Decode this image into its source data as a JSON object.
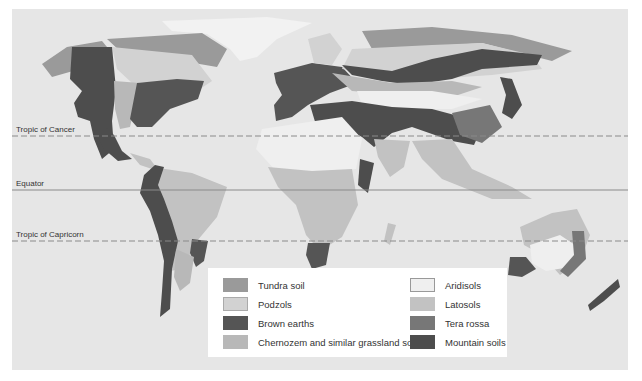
{
  "map": {
    "title": "World soil types",
    "reference_lines": [
      {
        "id": "tropic-of-cancer",
        "label": "Tropic of Cancer",
        "style": "dashed",
        "y": 127
      },
      {
        "id": "equator",
        "label": "Equator",
        "style": "solid",
        "y": 181
      },
      {
        "id": "tropic-of-capricorn",
        "label": "Tropic of Capricorn",
        "style": "dashed",
        "y": 232
      }
    ]
  },
  "legend": {
    "items": [
      {
        "label": "Tundra soil",
        "color": "#9a9a9a"
      },
      {
        "label": "Podzols",
        "color": "#d2d2d2"
      },
      {
        "label": "Brown earths",
        "color": "#555555"
      },
      {
        "label": "Chernozem and similar grassland soils",
        "color": "#b8b8b8"
      },
      {
        "label": "Aridisols",
        "color": "#efefef"
      },
      {
        "label": "Latosols",
        "color": "#c2c2c2"
      },
      {
        "label": "Tera rossa",
        "color": "#777777"
      },
      {
        "label": "Mountain soils",
        "color": "#4d4d4d"
      }
    ]
  },
  "colors": {
    "ocean": "#e6e6e6",
    "border": "#ffffff",
    "reference_line": "#8a8a8a"
  }
}
